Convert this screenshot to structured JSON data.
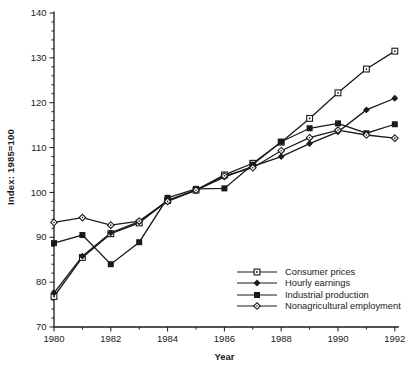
{
  "chart_data": {
    "type": "line",
    "title": "",
    "xlabel": "Year",
    "ylabel": "Index: 1985=100",
    "x": [
      1980,
      1981,
      1982,
      1983,
      1984,
      1985,
      1986,
      1987,
      1988,
      1989,
      1990,
      1991,
      1992
    ],
    "x_major_ticks": [
      1980,
      1982,
      1984,
      1986,
      1988,
      1990,
      1992
    ],
    "x_minor_step": 1,
    "ylim": [
      70,
      140
    ],
    "y_major_ticks": [
      70,
      80,
      90,
      100,
      110,
      120,
      130,
      140
    ],
    "y_minor_step": 2,
    "grid": false,
    "legend_position": "inside-lower-right",
    "line_color": "#1a1a1a",
    "background_color": "#ffffff",
    "series": [
      {
        "name": "Consumer prices",
        "marker": "open-square-dot",
        "values": [
          76.8,
          85.5,
          90.8,
          93.2,
          98.2,
          100.5,
          103.9,
          106.5,
          111.2,
          116.5,
          122.2,
          127.5,
          131.5
        ]
      },
      {
        "name": "Hourly earnings",
        "marker": "filled-diamond",
        "values": [
          77.6,
          85.8,
          91.0,
          93.5,
          98.2,
          100.5,
          103.4,
          105.8,
          108.0,
          110.9,
          113.5,
          118.4,
          121.0
        ]
      },
      {
        "name": "Industrial production",
        "marker": "filled-square",
        "values": [
          88.7,
          90.5,
          84.0,
          88.9,
          98.8,
          100.8,
          100.9,
          106.2,
          111.3,
          114.3,
          115.4,
          113.2,
          115.2
        ]
      },
      {
        "name": "Nonagricultural employment",
        "marker": "open-diamond-dot",
        "values": [
          93.3,
          94.4,
          92.7,
          93.6,
          98.0,
          100.5,
          103.7,
          105.5,
          109.3,
          112.2,
          113.9,
          112.8,
          112.1
        ]
      }
    ]
  }
}
